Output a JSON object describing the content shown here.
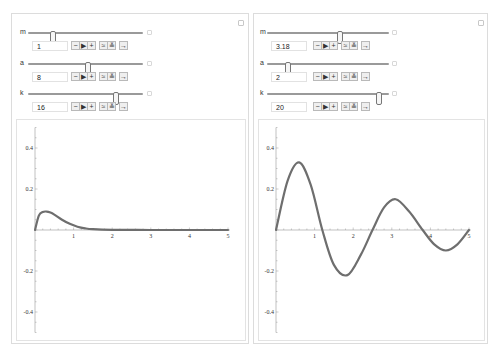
{
  "panels": [
    {
      "controls": [
        {
          "name": "m",
          "value": "1",
          "min": 0,
          "max": 5
        },
        {
          "name": "a",
          "value": "8",
          "min": 0,
          "max": 15
        },
        {
          "name": "k",
          "value": "16",
          "min": 0,
          "max": 20
        }
      ],
      "buttons": [
        "−",
        "▶",
        "+",
        "≈",
        "≚",
        "→"
      ]
    },
    {
      "controls": [
        {
          "name": "m",
          "value": "3.18",
          "min": 0,
          "max": 5
        },
        {
          "name": "a",
          "value": "2",
          "min": 0,
          "max": 15
        },
        {
          "name": "k",
          "value": "20",
          "min": 0,
          "max": 20
        }
      ],
      "buttons": [
        "−",
        "▶",
        "+",
        "≈",
        "≚",
        "→"
      ]
    }
  ],
  "chart_data": [
    {
      "type": "line",
      "title": "",
      "xlabel": "",
      "ylabel": "",
      "xlim": [
        0,
        5
      ],
      "ylim": [
        -0.5,
        0.5
      ],
      "x_ticks": [
        "1",
        "2",
        "3",
        "4",
        "5"
      ],
      "y_ticks": [
        "0.4",
        "0.2",
        "-0.2",
        "-0.4"
      ],
      "x": [
        0,
        0.1,
        0.2,
        0.3,
        0.4,
        0.5,
        0.7,
        0.9,
        1.1,
        1.3,
        1.5,
        2,
        3,
        4,
        5
      ],
      "y": [
        0,
        0.07,
        0.088,
        0.09,
        0.085,
        0.075,
        0.05,
        0.03,
        0.016,
        0.008,
        0.004,
        0.001,
        0,
        0,
        0
      ],
      "grid": false,
      "color": "#6e6e6e"
    },
    {
      "type": "line",
      "title": "",
      "xlabel": "",
      "ylabel": "",
      "xlim": [
        0,
        5
      ],
      "ylim": [
        -0.5,
        0.5
      ],
      "x_ticks": [
        "1",
        "2",
        "3",
        "4",
        "5"
      ],
      "y_ticks": [
        "0.4",
        "0.2",
        "-0.2",
        "-0.4"
      ],
      "x": [
        0,
        0.3,
        0.6,
        0.9,
        1.2,
        1.5,
        1.85,
        2.2,
        2.5,
        2.8,
        3.1,
        3.45,
        3.8,
        4.1,
        4.4,
        4.7,
        5
      ],
      "y": [
        0,
        0.24,
        0.33,
        0.22,
        0.0,
        -0.17,
        -0.22,
        -0.12,
        0.0,
        0.11,
        0.15,
        0.09,
        0.0,
        -0.07,
        -0.1,
        -0.07,
        0.0
      ],
      "grid": false,
      "color": "#6e6e6e"
    }
  ]
}
